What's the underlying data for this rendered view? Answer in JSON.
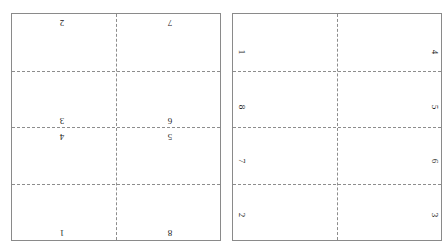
{
  "figure": {
    "type": "imposition-layout-diagram",
    "background_color": "#ffffff",
    "sheet_border_color": "#8a8a8a",
    "fold_line_color": "#8d8d8d",
    "label_color": "#1a1a1a"
  },
  "sheets": [
    {
      "id": "sheet-left",
      "name": "left-sheet",
      "columns": 2,
      "rows": 4,
      "fold_lines": {
        "horizontal_count": 3,
        "vertical_count": 1
      },
      "cells": [
        {
          "label": "2",
          "rotation": 180,
          "col": 0,
          "row": 0,
          "x_pct": 24,
          "y_pct": 3.5
        },
        {
          "label": "7",
          "rotation": 180,
          "col": 1,
          "row": 0,
          "x_pct": 76,
          "y_pct": 3.5
        },
        {
          "label": "3",
          "rotation": 180,
          "col": 0,
          "row": 1,
          "x_pct": 24,
          "y_pct": 50.5
        },
        {
          "label": "6",
          "rotation": 180,
          "col": 1,
          "row": 1,
          "x_pct": 76,
          "y_pct": 50.5
        },
        {
          "label": "4",
          "rotation": 180,
          "col": 0,
          "row": 2,
          "x_pct": 24,
          "y_pct": 57
        },
        {
          "label": "5",
          "rotation": 180,
          "col": 1,
          "row": 2,
          "x_pct": 76,
          "y_pct": 57
        },
        {
          "label": "1",
          "rotation": 180,
          "col": 0,
          "row": 3,
          "x_pct": 24,
          "y_pct": 96.5
        },
        {
          "label": "8",
          "rotation": 180,
          "col": 1,
          "row": 3,
          "x_pct": 76,
          "y_pct": 96.5
        }
      ]
    },
    {
      "id": "sheet-right",
      "name": "right-sheet",
      "columns": 2,
      "rows": 4,
      "fold_lines": {
        "horizontal_count": 3,
        "vertical_count": 1
      },
      "cells": [
        {
          "label": "1",
          "rotation": 90,
          "col": 0,
          "row": 0,
          "x_pct": 3.5,
          "y_pct": 17
        },
        {
          "label": "4",
          "rotation": 90,
          "col": 1,
          "row": 0,
          "x_pct": 96.5,
          "y_pct": 17
        },
        {
          "label": "8",
          "rotation": 90,
          "col": 0,
          "row": 1,
          "x_pct": 3.5,
          "y_pct": 41
        },
        {
          "label": "5",
          "rotation": 90,
          "col": 1,
          "row": 1,
          "x_pct": 96.5,
          "y_pct": 41
        },
        {
          "label": "7",
          "rotation": 90,
          "col": 0,
          "row": 2,
          "x_pct": 3.5,
          "y_pct": 65
        },
        {
          "label": "6",
          "rotation": 90,
          "col": 1,
          "row": 2,
          "x_pct": 96.5,
          "y_pct": 65
        },
        {
          "label": "2",
          "rotation": 90,
          "col": 0,
          "row": 3,
          "x_pct": 3.5,
          "y_pct": 89
        },
        {
          "label": "3",
          "rotation": 90,
          "col": 1,
          "row": 3,
          "x_pct": 96.5,
          "y_pct": 89
        }
      ]
    }
  ],
  "fold_positions": {
    "horizontal_pct": [
      25,
      50,
      75
    ],
    "vertical_pct": [
      50
    ]
  }
}
